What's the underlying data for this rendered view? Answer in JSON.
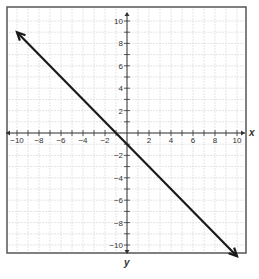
{
  "chart_data": {
    "type": "line",
    "title": "",
    "xlabel": "x",
    "ylabel": "y",
    "xlim": [
      -10,
      10
    ],
    "ylim": [
      -10,
      10
    ],
    "grid": true,
    "x_ticks_labeled": [
      -10,
      -8,
      -6,
      -4,
      -2,
      2,
      4,
      6,
      8,
      10
    ],
    "y_ticks_labeled": [
      10,
      8,
      6,
      4,
      2,
      -2,
      -4,
      -6,
      -8,
      -10
    ],
    "series": [
      {
        "name": "line",
        "equation": "y = -x - 1",
        "points": [
          [
            -10,
            9
          ],
          [
            10,
            -11
          ]
        ],
        "arrows": "both",
        "color": "#1a1a1a"
      }
    ]
  },
  "style": {
    "frame_color": "#555555",
    "grid_color": "#dddddd",
    "axis_color": "#333333",
    "line_color": "#1a1a1a"
  }
}
